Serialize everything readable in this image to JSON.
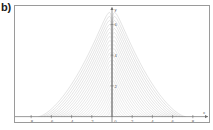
{
  "panel": {
    "label": "b)"
  },
  "figure": {
    "background": "#ffffff",
    "frame_color": "#9a9a9a",
    "axis_color": "#6e6e6e",
    "curve_color": "#b9b9b9"
  },
  "chart_data": {
    "type": "line",
    "title": "",
    "xlabel": "x",
    "ylabel": "y",
    "grid": false,
    "legend": null,
    "xlim": [
      -9.6,
      9.6
    ],
    "ylim": [
      -0.35,
      7.2
    ],
    "xticks": [
      -8,
      -6,
      -4,
      -2,
      0,
      2,
      4,
      6,
      8
    ],
    "xticklabels": [
      "-8",
      "-6",
      "-4",
      "-2",
      "0",
      "2",
      "4",
      "6",
      "8"
    ],
    "yticks": [
      2,
      4,
      6
    ],
    "yticklabels": [
      "2",
      "4",
      "6"
    ],
    "axis_arrows": [
      "x-right",
      "y-up"
    ],
    "n_curves": 26,
    "series_parameter": "a",
    "series_parameter_values": [
      0.28,
      0.56,
      0.84,
      1.12,
      1.4,
      1.68,
      1.96,
      2.24,
      2.52,
      2.8,
      3.08,
      3.36,
      3.64,
      3.92,
      4.2,
      4.48,
      4.76,
      5.04,
      5.32,
      5.6,
      5.88,
      6.16,
      6.44,
      6.72,
      7.0,
      7.28
    ],
    "series": [
      {
        "name": "a=0.28",
        "x": [
          -0.28,
          -0.21,
          -0.14,
          -0.07,
          0,
          0.07,
          0.14,
          0.21,
          0.28
        ],
        "y": [
          0,
          0.1,
          0.16,
          0.19,
          0.2,
          0.19,
          0.16,
          0.1,
          0
        ]
      },
      {
        "name": "a=7.28",
        "x": [
          -9.6,
          -7.2,
          -4.8,
          -2.4,
          0,
          2.4,
          4.8,
          7.2,
          9.6
        ],
        "y": [
          0.05,
          2.6,
          4.6,
          6.1,
          7.1,
          6.1,
          4.6,
          2.6,
          0.05
        ]
      }
    ]
  },
  "ticks": {
    "x": [
      {
        "label": "-8",
        "value": -8
      },
      {
        "label": "-6",
        "value": -6
      },
      {
        "label": "-4",
        "value": -4
      },
      {
        "label": "-2",
        "value": -2
      },
      {
        "label": "0",
        "value": 0
      },
      {
        "label": "2",
        "value": 2
      },
      {
        "label": "4",
        "value": 4
      },
      {
        "label": "6",
        "value": 6
      },
      {
        "label": "8",
        "value": 8
      }
    ],
    "y": [
      {
        "label": "2",
        "value": 2
      },
      {
        "label": "4",
        "value": 4
      },
      {
        "label": "6",
        "value": 6
      }
    ]
  },
  "axis_names": {
    "x": "x",
    "y": "y"
  }
}
